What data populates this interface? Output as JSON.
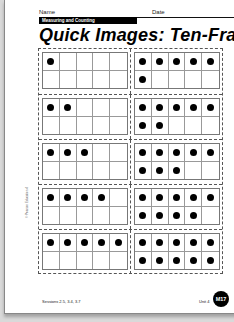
{
  "header": {
    "name_label": "Name",
    "date_label": "Date",
    "section": "Measuring and Counting",
    "title": "Quick Images: Ten-Frames"
  },
  "frames": [
    {
      "left": 1,
      "right": 6
    },
    {
      "left": 2,
      "right": 7
    },
    {
      "left": 3,
      "right": 8
    },
    {
      "left": 4,
      "right": 9
    },
    {
      "left": 5,
      "right": 10
    }
  ],
  "footer": {
    "sessions": "Sessions 2.5, 3.4, 3.7",
    "unit": "Unit 4",
    "page_badge": "M17",
    "copyright": "© Pearson Education 4"
  }
}
